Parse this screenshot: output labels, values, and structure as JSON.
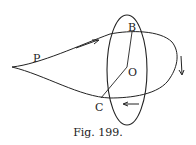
{
  "figure": {
    "caption": "Fig. 199.",
    "labels": {
      "P": "P",
      "B": "B",
      "O": "O",
      "C": "C"
    },
    "colors": {
      "ink": "#222222",
      "background": "#ffffff"
    }
  }
}
